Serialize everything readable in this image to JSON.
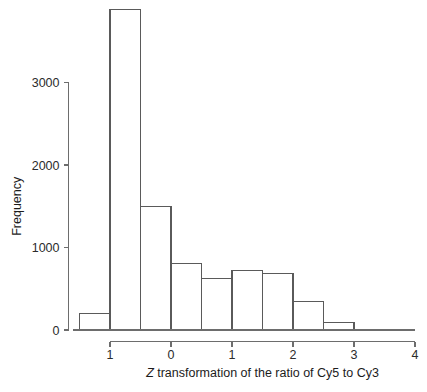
{
  "chart_data": {
    "type": "bar",
    "subtype": "histogram",
    "title": "",
    "xlabel": "Z transformation of the ratio of Cy5 to Cy3",
    "ylabel": "Frequency",
    "xlim": [
      -1.6,
      4.0
    ],
    "ylim": [
      0,
      4000
    ],
    "grid": false,
    "legend": null,
    "bin_width": 0.5,
    "bin_edges": [
      -1.5,
      -1.0,
      -0.5,
      0.0,
      0.5,
      1.0,
      1.5,
      2.0,
      2.5,
      3.0
    ],
    "categories": [
      "-1.5 to -1.0",
      "-1.0 to -0.5",
      "-0.5 to 0.0",
      "0.0 to 0.5",
      "0.5 to 1.0",
      "1.0 to 1.5",
      "1.5 to 2.0",
      "2.0 to 2.5",
      "2.5 to 3.0"
    ],
    "values": [
      200,
      3890,
      1500,
      810,
      630,
      720,
      690,
      340,
      90
    ],
    "xticks": [
      -1,
      0,
      1,
      2,
      3,
      4
    ],
    "xtick_labels": [
      "1",
      "0",
      "1",
      "2",
      "3",
      "4"
    ],
    "yticks": [
      0,
      1000,
      2000,
      3000
    ],
    "ytick_labels": [
      "0",
      "1000",
      "2000",
      "3000"
    ],
    "colors": {
      "bar_stroke": "#5a5a5a",
      "bar_fill": "none",
      "axis": "#6d6d6d",
      "text": "#1c1c1c",
      "background": "#ffffff"
    }
  },
  "axis_title_x_parts": {
    "italic": "Z",
    "rest": " transformation of the ratio of Cy5 to Cy3"
  },
  "axis_title_y": "Frequency"
}
